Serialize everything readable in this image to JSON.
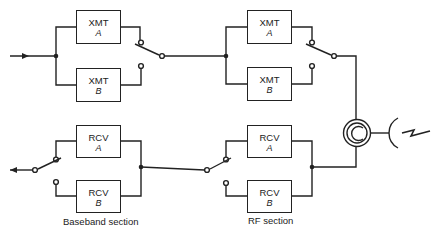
{
  "diagram": {
    "blocks": [
      {
        "id": "xmt-a-baseband",
        "label": "XMT",
        "sub": "A"
      },
      {
        "id": "xmt-b-baseband",
        "label": "XMT",
        "sub": "B"
      },
      {
        "id": "xmt-a-rf",
        "label": "XMT",
        "sub": "A"
      },
      {
        "id": "xmt-b-rf",
        "label": "XMT",
        "sub": "B"
      },
      {
        "id": "rcv-a-baseband",
        "label": "RCV",
        "sub": "A"
      },
      {
        "id": "rcv-b-baseband",
        "label": "RCV",
        "sub": "B"
      },
      {
        "id": "rcv-a-rf",
        "label": "RCV",
        "sub": "A"
      },
      {
        "id": "rcv-b-rf",
        "label": "RCV",
        "sub": "B"
      }
    ],
    "section_labels": {
      "baseband": "Baseband section",
      "rf": "RF section"
    },
    "symbols": [
      "input-arrow",
      "output-arrow",
      "switch",
      "circulator",
      "antenna",
      "lightning"
    ],
    "colors": {
      "line": "#222222",
      "background": "#ffffff"
    }
  }
}
